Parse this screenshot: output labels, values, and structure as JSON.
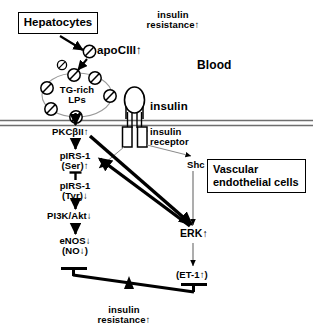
{
  "figure": {
    "width": 313,
    "height": 335,
    "background_color": "#ffffff",
    "stroke_color": "#000000"
  },
  "compartments": {
    "blood_label": "Blood",
    "source_box_label": "Hepatocytes",
    "cell_box_label": "Vascular\nendothelial cells"
  },
  "blood_phase": {
    "insulin_resistance_label": "insulin\nresistance↑",
    "apociii_label": "apoCIII↑",
    "lipoprotein_label": "TG-rich\nLPs",
    "insulin_label": "insulin",
    "apociii_particle_count": 8
  },
  "membrane": {
    "receptor_label": "insulin\nreceptor"
  },
  "cascade_left": [
    {
      "id": "pkc",
      "label": "PKCβII↑"
    },
    {
      "id": "pirs-ser",
      "label": "pIRS-1\n(Ser)↑"
    },
    {
      "id": "pirs-tyr",
      "label": "pIRS-1\n(Tyr)↓"
    },
    {
      "id": "pi3k-akt",
      "label": "PI3K/Akt↓"
    },
    {
      "id": "enos",
      "label": "eNOS↓\n(NO↓)"
    }
  ],
  "cascade_right": [
    {
      "id": "shc",
      "label": "Shc"
    },
    {
      "id": "erk",
      "label": "ERK↑"
    },
    {
      "id": "et1",
      "label": "(ET-1↑)"
    }
  ],
  "balance": {
    "fulcrum_label": "insulin\nresistance↑",
    "tilt": "down-right",
    "left_arm_end": "eNOS/NO",
    "right_arm_end": "ET-1"
  }
}
